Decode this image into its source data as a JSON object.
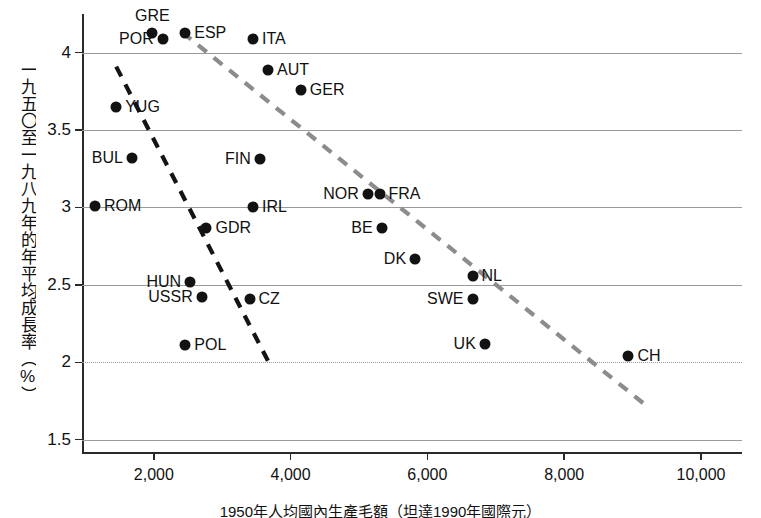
{
  "chart_data": {
    "type": "scatter",
    "title": "",
    "ylabel": "一九五〇至一九八九年的年平均成長率（%）",
    "xlabel": "1950年人均國內生產毛額（坦達1990年國際元）",
    "xlim": [
      950,
      10600
    ],
    "ylim": [
      1.42,
      4.25
    ],
    "xticks": [
      2000,
      4000,
      6000,
      8000,
      10000
    ],
    "xticklabels": [
      "2,000",
      "4,000",
      "6,000",
      "8,000",
      "10,000"
    ],
    "yticks": [
      1.5,
      2,
      2.5,
      3,
      3.5,
      4
    ],
    "yticklabels": [
      "1.5",
      "2",
      "2.5",
      "3",
      "3.5",
      "4"
    ],
    "grid": "horizontal",
    "points": [
      {
        "label": "GRE",
        "x": 1980,
        "y": 4.13,
        "pos": "t"
      },
      {
        "label": "POR",
        "x": 2130,
        "y": 4.09,
        "pos": "l"
      },
      {
        "label": "ESP",
        "x": 2460,
        "y": 4.13,
        "pos": "r"
      },
      {
        "label": "ITA",
        "x": 3450,
        "y": 4.09,
        "pos": "r"
      },
      {
        "label": "AUT",
        "x": 3670,
        "y": 3.89,
        "pos": "r"
      },
      {
        "label": "GER",
        "x": 4150,
        "y": 3.76,
        "pos": "r"
      },
      {
        "label": "YUG",
        "x": 1450,
        "y": 3.65,
        "pos": "r"
      },
      {
        "label": "BUL",
        "x": 1680,
        "y": 3.32,
        "pos": "l"
      },
      {
        "label": "FIN",
        "x": 3550,
        "y": 3.31,
        "pos": "l"
      },
      {
        "label": "ROM",
        "x": 1140,
        "y": 3.01,
        "pos": "r"
      },
      {
        "label": "IRL",
        "x": 3450,
        "y": 3.0,
        "pos": "r"
      },
      {
        "label": "NOR",
        "x": 5130,
        "y": 3.09,
        "pos": "l"
      },
      {
        "label": "FRA",
        "x": 5300,
        "y": 3.09,
        "pos": "r"
      },
      {
        "label": "GDR",
        "x": 2770,
        "y": 2.87,
        "pos": "r"
      },
      {
        "label": "BE",
        "x": 5330,
        "y": 2.87,
        "pos": "l"
      },
      {
        "label": "DK",
        "x": 5820,
        "y": 2.67,
        "pos": "l"
      },
      {
        "label": "NL",
        "x": 6660,
        "y": 2.56,
        "pos": "r"
      },
      {
        "label": "HUN",
        "x": 2530,
        "y": 2.52,
        "pos": "l"
      },
      {
        "label": "USSR",
        "x": 2700,
        "y": 2.42,
        "pos": "l"
      },
      {
        "label": "CZ",
        "x": 3400,
        "y": 2.41,
        "pos": "r"
      },
      {
        "label": "SWE",
        "x": 6660,
        "y": 2.41,
        "pos": "l"
      },
      {
        "label": "POL",
        "x": 2460,
        "y": 2.11,
        "pos": "r"
      },
      {
        "label": "UK",
        "x": 6840,
        "y": 2.12,
        "pos": "l"
      },
      {
        "label": "CH",
        "x": 8940,
        "y": 2.04,
        "pos": "r"
      }
    ],
    "trendlines": [
      {
        "name": "eastern-europe-trend",
        "style": "dashed",
        "color": "#141414",
        "x1": 1450,
        "y1": 3.91,
        "x2": 3680,
        "y2": 2.0
      },
      {
        "name": "western-europe-trend",
        "style": "dashed",
        "color": "#8c8c8c",
        "x1": 2420,
        "y1": 4.13,
        "x2": 9200,
        "y2": 1.72
      }
    ]
  },
  "axes": {
    "x_axis_name": "gdp-per-capita-1950",
    "y_axis_name": "average-annual-growth-rate"
  }
}
